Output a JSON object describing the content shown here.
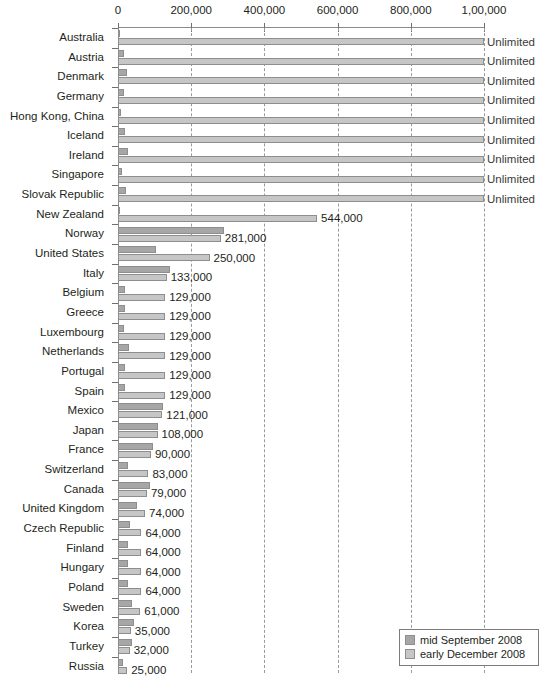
{
  "chart_data": {
    "type": "bar",
    "orientation": "horizontal",
    "title": "",
    "subtitle": "",
    "xlabel": "",
    "ylabel": "",
    "xlim": [
      0,
      1000000
    ],
    "grid": true,
    "grid_style": "dashed-vertical",
    "legend_position": "bottom-right",
    "tick_values": [
      0,
      200000,
      400000,
      600000,
      800000,
      1000000
    ],
    "tick_labels": [
      "0",
      "200,000",
      "400,000",
      "600,000",
      "800,000",
      "1,00,000"
    ],
    "unlimited_label": "Unlimited",
    "colors": {
      "mid_september_2008": "#a6a6a6",
      "early_december_2008": "#c6c6c6",
      "axis": "#8b8b8b",
      "gridline": "#9a9a9a",
      "text": "#231f20"
    },
    "series": [
      {
        "name": "mid September 2008",
        "key": "sep",
        "color": "#a6a6a6",
        "values": [
          1500,
          17000,
          24000,
          16000,
          8000,
          18000,
          26000,
          10000,
          22000,
          5000,
          290000,
          103000,
          143000,
          18000,
          19000,
          17000,
          30000,
          20000,
          19000,
          123000,
          110000,
          95000,
          27000,
          88000,
          52000,
          32000,
          28000,
          28000,
          28000,
          39000,
          43000,
          39000,
          13000
        ]
      },
      {
        "name": "early December 2008",
        "key": "dec",
        "color": "#c6c6c6",
        "values": [
          1000000,
          1000000,
          1000000,
          1000000,
          1000000,
          1000000,
          1000000,
          1000000,
          1000000,
          544000,
          281000,
          250000,
          133000,
          129000,
          129000,
          129000,
          129000,
          129000,
          129000,
          121000,
          108000,
          90000,
          83000,
          79000,
          74000,
          64000,
          64000,
          64000,
          64000,
          61000,
          35000,
          32000,
          25000
        ]
      }
    ],
    "categories": [
      "Australia",
      "Austria",
      "Denmark",
      "Germany",
      "Hong Kong, China",
      "Iceland",
      "Ireland",
      "Singapore",
      "Slovak Republic",
      "New Zealand",
      "Norway",
      "United States",
      "Italy",
      "Belgium",
      "Greece",
      "Luxembourg",
      "Netherlands",
      "Portugal",
      "Spain",
      "Mexico",
      "Japan",
      "France",
      "Switzerland",
      "Canada",
      "United Kingdom",
      "Czech Republic",
      "Finland",
      "Hungary",
      "Poland",
      "Sweden",
      "Korea",
      "Turkey",
      "Russia"
    ],
    "value_labels": [
      "Unlimited",
      "Unlimited",
      "Unlimited",
      "Unlimited",
      "Unlimited",
      "Unlimited",
      "Unlimited",
      "Unlimited",
      "Unlimited",
      "544,000",
      "281,000",
      "250,000",
      "133,000",
      "129,000",
      "129,000",
      "129,000",
      "129,000",
      "129,000",
      "129,000",
      "121,000",
      "108,000",
      "90,000",
      "83,000",
      "79,000",
      "74,000",
      "64,000",
      "64,000",
      "64,000",
      "64,000",
      "61,000",
      "35,000",
      "32,000",
      "25,000"
    ],
    "unlimited_flags": [
      true,
      true,
      true,
      true,
      true,
      true,
      true,
      true,
      true,
      false,
      false,
      false,
      false,
      false,
      false,
      false,
      false,
      false,
      false,
      false,
      false,
      false,
      false,
      false,
      false,
      false,
      false,
      false,
      false,
      false,
      false,
      false,
      false
    ]
  },
  "legend": {
    "items": [
      {
        "label": "mid September 2008",
        "key": "sep"
      },
      {
        "label": "early December 2008",
        "key": "dec"
      }
    ]
  }
}
